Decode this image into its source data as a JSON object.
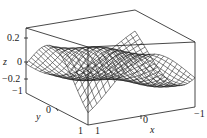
{
  "chart_data": {
    "type": "surface3d",
    "title": "",
    "function_description": "wireframe surface z(x,y) on [-1,1]x[-1,1], saddle-like wave with peaks at back corners and dip near center",
    "xlabel": "x",
    "ylabel": "y",
    "zlabel": "z",
    "x_ticks": [
      "1",
      "0",
      "-1"
    ],
    "y_ticks": [
      "-1",
      "0",
      "1"
    ],
    "z_ticks": [
      "0.2",
      "0",
      "-0.2",
      "-1"
    ],
    "xlim": [
      -1,
      1
    ],
    "ylim": [
      -1,
      1
    ],
    "zlim": [
      -0.3,
      0.3
    ],
    "grid_lines": 24,
    "box": true,
    "line_color": "#1a1a1a",
    "background": "#ffffff"
  },
  "labels": {
    "z_tick_0_2": "0.2",
    "z_tick_0": "0",
    "z_tick_neg_0_2": "−0.2",
    "z_tick_neg1": "−1",
    "z_axis": "z",
    "y_axis": "y",
    "y_tick_0": "0",
    "y_tick_1": "1",
    "x_tick_1": "1",
    "x_tick_0": "0",
    "x_tick_neg1": "−1",
    "x_axis": "x"
  }
}
